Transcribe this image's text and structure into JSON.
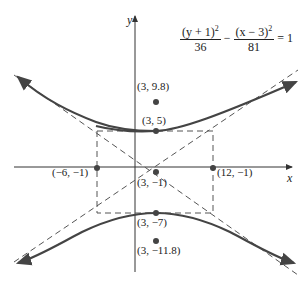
{
  "equation": {
    "term1_numerator": "(y + 1)",
    "term1_exp": "2",
    "term1_denominator": "36",
    "operator": "−",
    "term2_numerator": "(x − 3)",
    "term2_exp": "2",
    "term2_denominator": "81",
    "rhs": "= 1"
  },
  "axes": {
    "x_label": "x",
    "y_label": "y"
  },
  "points": {
    "focus_top": "(3, 9.8)",
    "vertex_top": "(3, 5)",
    "center": "(3, −1)",
    "left": "(−6, −1)",
    "right": "(12, −1)",
    "vertex_bottom": "(3, −7)",
    "focus_bottom": "(3, −11.8)"
  },
  "colors": {
    "curve": "#444444",
    "axis": "#333333",
    "dashed": "#555555",
    "point": "#444444"
  }
}
